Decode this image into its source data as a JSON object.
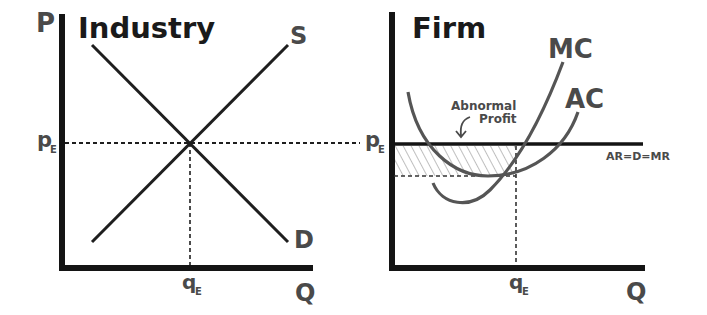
{
  "colors": {
    "axis": "#141414",
    "curve_dark": "#1e1e1e",
    "curve_grey": "#555555",
    "label": "#4a4a4a",
    "hatch": "#8a8a8a"
  },
  "industry": {
    "title": "Industry",
    "y_axis_label": "P",
    "x_axis_label": "Q",
    "price_label": "p",
    "price_sub": "E",
    "qty_label": "q",
    "qty_sub": "E",
    "supply_label": "S",
    "demand_label": "D"
  },
  "firm": {
    "title": "Firm",
    "x_axis_label": "Q",
    "price_label": "p",
    "price_sub": "E",
    "qty_label": "q",
    "qty_sub": "E",
    "mc_label": "MC",
    "ac_label": "AC",
    "demand_label": "AR=D=MR",
    "annotation_line1": "Abnormal",
    "annotation_line2": "Profit"
  }
}
